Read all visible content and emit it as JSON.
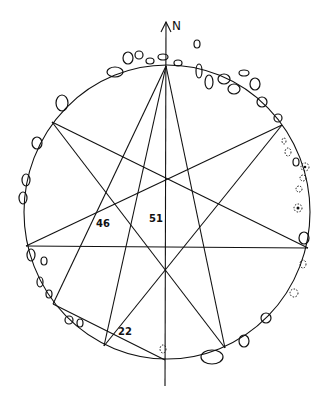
{
  "diagram": {
    "north_label": "N",
    "labels": [
      {
        "text": "46",
        "x": 96,
        "y": 227
      },
      {
        "text": "51",
        "x": 151,
        "y": 224
      },
      {
        "text": "22",
        "x": 120,
        "y": 335
      }
    ],
    "circle": {
      "cx": 167,
      "cy": 212,
      "r": 146
    },
    "vertices": {
      "top": [
        166,
        66
      ],
      "upper_left": [
        52,
        122
      ],
      "upper_right": [
        282,
        125
      ],
      "left": [
        26,
        246
      ],
      "right": [
        308,
        248
      ],
      "lower_left": [
        53,
        304
      ],
      "lower_mid_left": [
        104,
        346
      ],
      "bottom": [
        165,
        360
      ],
      "lower_right": [
        225,
        348
      ]
    },
    "stroke_color": "#111111",
    "background": "#ffffff"
  }
}
